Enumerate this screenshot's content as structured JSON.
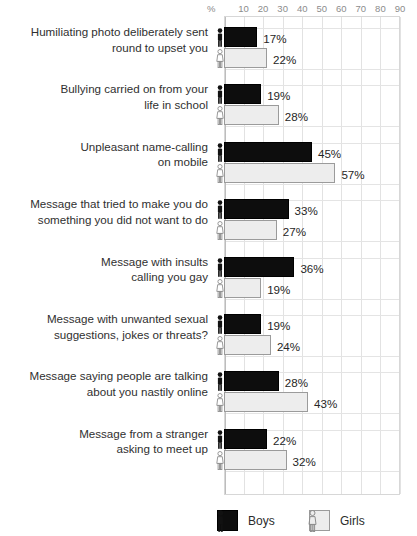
{
  "chart_data": {
    "type": "bar",
    "orientation": "horizontal",
    "title": "",
    "xlabel": "%",
    "ylabel": "",
    "xlim": [
      0,
      90
    ],
    "xticks": [
      10,
      20,
      30,
      40,
      50,
      60,
      70,
      80,
      90
    ],
    "grid": true,
    "legend_position": "bottom",
    "categories": [
      "Humiliating photo deliberately sent\nround to upset you",
      "Bullying carried on from your\nlife in school",
      "Unpleasant name-calling\non mobile",
      "Message that tried to make you do\nsomething you did not want to do",
      "Message with insults\ncalling you gay",
      "Message with unwanted sexual\nsuggestions, jokes or threats?",
      "Message saying people are talking\nabout you nastily online",
      "Message from a stranger\nasking to meet up"
    ],
    "series": [
      {
        "name": "Boys",
        "color": "#0d0d0d",
        "values": [
          17,
          19,
          45,
          33,
          36,
          19,
          28,
          22
        ],
        "labels": [
          "17%",
          "19%",
          "45%",
          "33%",
          "36%",
          "19%",
          "28%",
          "22%"
        ]
      },
      {
        "name": "Girls",
        "color": "#ededed",
        "values": [
          22,
          28,
          57,
          27,
          19,
          24,
          43,
          32
        ],
        "labels": [
          "22%",
          "28%",
          "57%",
          "27%",
          "19%",
          "24%",
          "43%",
          "32%"
        ]
      }
    ]
  },
  "axis": {
    "unit": "%",
    "tick_labels": [
      "10",
      "20",
      "30",
      "40",
      "50",
      "60",
      "70",
      "80",
      "90"
    ]
  },
  "legend": {
    "items": [
      {
        "label": "Boys",
        "icon": "male-figure-icon"
      },
      {
        "label": "Girls",
        "icon": "female-figure-icon"
      }
    ]
  }
}
